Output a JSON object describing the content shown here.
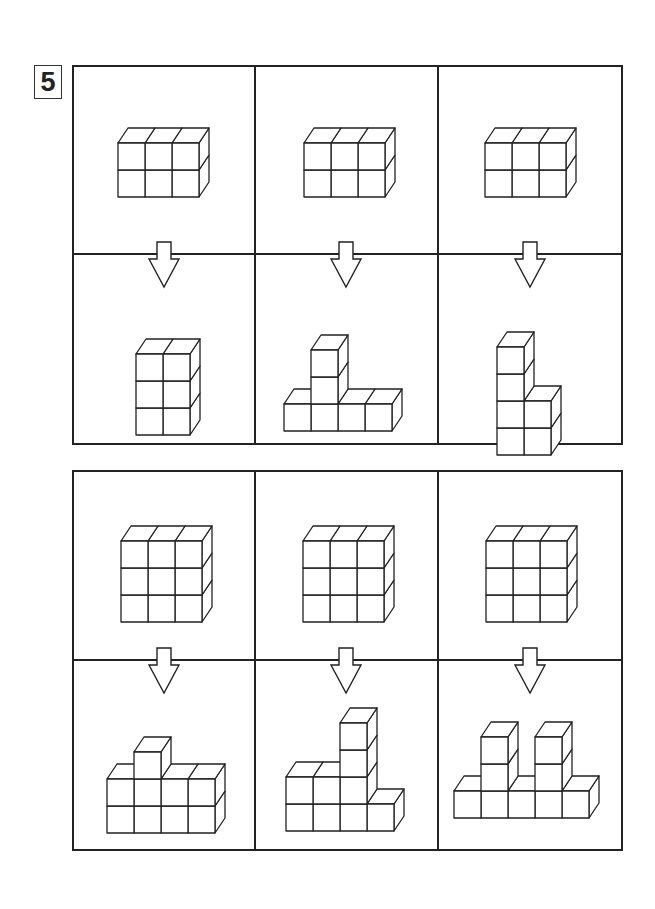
{
  "problem": {
    "number": "5"
  },
  "cube": {
    "size": 27,
    "dx": 10,
    "dy": -15,
    "stroke": "#222222",
    "fill": "#ffffff"
  },
  "panels": [
    {
      "id": "panel-top",
      "columns": [
        {
          "source": {
            "label": "3x2x1 block",
            "anchor": [
              44,
              130
            ],
            "cubes": [
              [
                0,
                0
              ],
              [
                1,
                0
              ],
              [
                2,
                0
              ],
              [
                0,
                1
              ],
              [
                1,
                1
              ],
              [
                2,
                1
              ]
            ]
          },
          "result": {
            "label": "2 wide, 3 tall",
            "anchor": [
              62,
              180
            ],
            "cubes": [
              [
                0,
                0
              ],
              [
                1,
                0
              ],
              [
                0,
                1
              ],
              [
                1,
                1
              ],
              [
                0,
                2
              ],
              [
                1,
                2
              ]
            ]
          }
        },
        {
          "source": {
            "label": "3x2x1 block",
            "anchor": [
              48,
              130
            ],
            "cubes": [
              [
                0,
                0
              ],
              [
                1,
                0
              ],
              [
                2,
                0
              ],
              [
                0,
                1
              ],
              [
                1,
                1
              ],
              [
                2,
                1
              ]
            ]
          },
          "result": {
            "label": "row of 4 with tower of 3 on column 2",
            "anchor": [
              28,
              176
            ],
            "cubes": [
              [
                0,
                0
              ],
              [
                1,
                0
              ],
              [
                2,
                0
              ],
              [
                3,
                0
              ],
              [
                1,
                1
              ],
              [
                1,
                2
              ]
            ]
          }
        },
        {
          "source": {
            "label": "3x2x1 block",
            "anchor": [
              46,
              130
            ],
            "cubes": [
              [
                0,
                0
              ],
              [
                1,
                0
              ],
              [
                2,
                0
              ],
              [
                0,
                1
              ],
              [
                1,
                1
              ],
              [
                2,
                1
              ]
            ]
          },
          "result": {
            "label": "tower of 4 with column of 2 beside it",
            "anchor": [
              58,
              200
            ],
            "cubes": [
              [
                0,
                0
              ],
              [
                1,
                0
              ],
              [
                0,
                1
              ],
              [
                1,
                1
              ],
              [
                0,
                2
              ],
              [
                0,
                3
              ]
            ]
          }
        }
      ]
    },
    {
      "id": "panel-bottom",
      "columns": [
        {
          "source": {
            "label": "3x3x1 block",
            "anchor": [
              47,
              150
            ],
            "cubes": [
              [
                0,
                0
              ],
              [
                1,
                0
              ],
              [
                2,
                0
              ],
              [
                0,
                1
              ],
              [
                1,
                1
              ],
              [
                2,
                1
              ],
              [
                0,
                2
              ],
              [
                1,
                2
              ],
              [
                2,
                2
              ]
            ]
          },
          "result": {
            "label": "4 wide, 2 tall, plus one on column 2",
            "anchor": [
              33,
              172
            ],
            "cubes": [
              [
                0,
                0
              ],
              [
                1,
                0
              ],
              [
                2,
                0
              ],
              [
                3,
                0
              ],
              [
                0,
                1
              ],
              [
                1,
                1
              ],
              [
                2,
                1
              ],
              [
                3,
                1
              ],
              [
                1,
                2
              ]
            ]
          }
        },
        {
          "source": {
            "label": "3x3x1 block",
            "anchor": [
              47,
              150
            ],
            "cubes": [
              [
                0,
                0
              ],
              [
                1,
                0
              ],
              [
                2,
                0
              ],
              [
                0,
                1
              ],
              [
                1,
                1
              ],
              [
                2,
                1
              ],
              [
                0,
                2
              ],
              [
                1,
                2
              ],
              [
                2,
                2
              ]
            ]
          },
          "result": {
            "label": "staircase: 3 wide x2 tall, tower of 4, one extra",
            "anchor": [
              30,
              170
            ],
            "cubes": [
              [
                0,
                0
              ],
              [
                1,
                0
              ],
              [
                2,
                0
              ],
              [
                3,
                0
              ],
              [
                0,
                1
              ],
              [
                1,
                1
              ],
              [
                2,
                1
              ],
              [
                2,
                2
              ],
              [
                2,
                3
              ]
            ]
          }
        },
        {
          "source": {
            "label": "3x3x1 block",
            "anchor": [
              47,
              150
            ],
            "cubes": [
              [
                0,
                0
              ],
              [
                1,
                0
              ],
              [
                2,
                0
              ],
              [
                0,
                1
              ],
              [
                1,
                1
              ],
              [
                2,
                1
              ],
              [
                0,
                2
              ],
              [
                1,
                2
              ],
              [
                2,
                2
              ]
            ]
          },
          "result": {
            "label": "row of 5 with towers on columns 2 and 4",
            "anchor": [
              15,
              157
            ],
            "cubes": [
              [
                0,
                0
              ],
              [
                1,
                0
              ],
              [
                2,
                0
              ],
              [
                3,
                0
              ],
              [
                4,
                0
              ],
              [
                1,
                1
              ],
              [
                1,
                2
              ],
              [
                3,
                1
              ],
              [
                3,
                2
              ]
            ]
          }
        }
      ]
    }
  ],
  "arrow": {
    "label": "down-arrow",
    "direction": "down"
  }
}
